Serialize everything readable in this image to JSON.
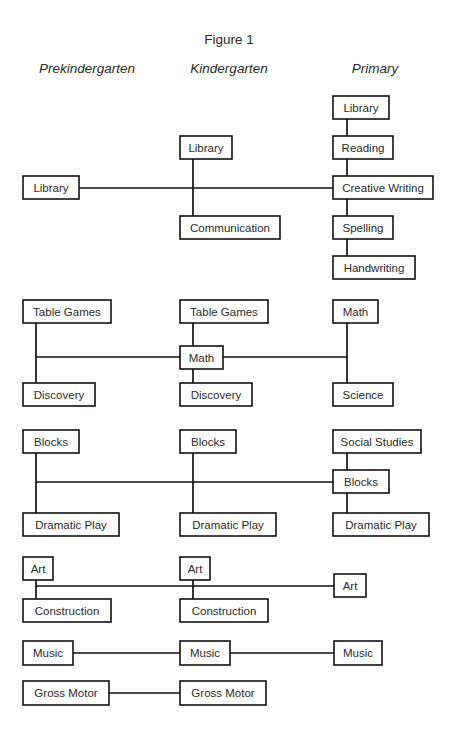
{
  "figure": {
    "title": "Figure 1",
    "title_x": 229,
    "title_y": 44
  },
  "columns": [
    {
      "id": "prekindergarten",
      "label": "Prekindergarten",
      "x": 87,
      "y": 73
    },
    {
      "id": "kindergarten",
      "label": "Kindergarten",
      "x": 229,
      "y": 73
    },
    {
      "id": "primary",
      "label": "Primary",
      "x": 375,
      "y": 73
    }
  ],
  "groups": [
    {
      "id": "language-arts",
      "nodes": [
        {
          "id": "pre-library",
          "label": "Library",
          "x": 23,
          "y": 176,
          "w": 56,
          "h": 23
        },
        {
          "id": "kin-library",
          "label": "Library",
          "x": 180,
          "y": 136,
          "w": 52,
          "h": 23
        },
        {
          "id": "kin-communication",
          "label": "Communication",
          "x": 180,
          "y": 216,
          "w": 100,
          "h": 23
        },
        {
          "id": "pri-library",
          "label": "Library",
          "x": 333,
          "y": 96,
          "w": 56,
          "h": 23
        },
        {
          "id": "pri-reading",
          "label": "Reading",
          "x": 333,
          "y": 136,
          "w": 60,
          "h": 23
        },
        {
          "id": "pri-creative-writing",
          "label": "Creative Writing",
          "x": 333,
          "y": 176,
          "w": 100,
          "h": 23
        },
        {
          "id": "pri-spelling",
          "label": "Spelling",
          "x": 333,
          "y": 216,
          "w": 60,
          "h": 23
        },
        {
          "id": "pri-handwriting",
          "label": "Handwriting",
          "x": 333,
          "y": 256,
          "w": 82,
          "h": 23
        }
      ],
      "links": [
        {
          "id": "la-spine-kin",
          "x1": 193,
          "y1": 159,
          "x2": 193,
          "y2": 216
        },
        {
          "id": "la-spine-pri-1",
          "x1": 347,
          "y1": 119,
          "x2": 347,
          "y2": 136
        },
        {
          "id": "la-spine-pri-2",
          "x1": 347,
          "y1": 159,
          "x2": 347,
          "y2": 176
        },
        {
          "id": "la-spine-pri-3",
          "x1": 347,
          "y1": 199,
          "x2": 347,
          "y2": 216
        },
        {
          "id": "la-spine-pri-4",
          "x1": 347,
          "y1": 239,
          "x2": 347,
          "y2": 256
        },
        {
          "id": "la-horizontal",
          "x1": 79,
          "y1": 188,
          "x2": 333,
          "y2": 188
        }
      ]
    },
    {
      "id": "math-science",
      "nodes": [
        {
          "id": "pre-table-games",
          "label": "Table Games",
          "x": 23,
          "y": 300,
          "w": 88,
          "h": 23
        },
        {
          "id": "pre-discovery",
          "label": "Discovery",
          "x": 23,
          "y": 383,
          "w": 72,
          "h": 23
        },
        {
          "id": "kin-table-games",
          "label": "Table Games",
          "x": 180,
          "y": 300,
          "w": 88,
          "h": 23
        },
        {
          "id": "kin-math",
          "label": "Math",
          "x": 180,
          "y": 346,
          "w": 43,
          "h": 23
        },
        {
          "id": "kin-discovery",
          "label": "Discovery",
          "x": 180,
          "y": 383,
          "w": 72,
          "h": 23
        },
        {
          "id": "pri-math",
          "label": "Math",
          "x": 333,
          "y": 300,
          "w": 45,
          "h": 23
        },
        {
          "id": "pri-science",
          "label": "Science",
          "x": 333,
          "y": 383,
          "w": 60,
          "h": 23
        }
      ],
      "links": [
        {
          "id": "ms-spine-pre",
          "x1": 36,
          "y1": 323,
          "x2": 36,
          "y2": 383
        },
        {
          "id": "ms-spine-kin-1",
          "x1": 193,
          "y1": 323,
          "x2": 193,
          "y2": 346
        },
        {
          "id": "ms-spine-kin-2",
          "x1": 193,
          "y1": 369,
          "x2": 193,
          "y2": 383
        },
        {
          "id": "ms-spine-pri",
          "x1": 347,
          "y1": 323,
          "x2": 347,
          "y2": 383
        },
        {
          "id": "ms-horiz-left",
          "x1": 36,
          "y1": 357,
          "x2": 180,
          "y2": 357
        },
        {
          "id": "ms-horiz-right",
          "x1": 223,
          "y1": 357,
          "x2": 347,
          "y2": 357
        }
      ]
    },
    {
      "id": "social-play",
      "nodes": [
        {
          "id": "pre-blocks",
          "label": "Blocks",
          "x": 23,
          "y": 430,
          "w": 56,
          "h": 23
        },
        {
          "id": "pre-dramatic-play",
          "label": "Dramatic Play",
          "x": 23,
          "y": 513,
          "w": 96,
          "h": 23
        },
        {
          "id": "kin-blocks",
          "label": "Blocks",
          "x": 180,
          "y": 430,
          "w": 56,
          "h": 23
        },
        {
          "id": "kin-dramatic-play",
          "label": "Dramatic Play",
          "x": 180,
          "y": 513,
          "w": 96,
          "h": 23
        },
        {
          "id": "pri-social-studies",
          "label": "Social Studies",
          "x": 333,
          "y": 430,
          "w": 88,
          "h": 23
        },
        {
          "id": "pri-blocks",
          "label": "Blocks",
          "x": 333,
          "y": 470,
          "w": 56,
          "h": 23
        },
        {
          "id": "pri-dramatic-play",
          "label": "Dramatic Play",
          "x": 333,
          "y": 513,
          "w": 96,
          "h": 23
        }
      ],
      "links": [
        {
          "id": "sp-spine-pre",
          "x1": 36,
          "y1": 453,
          "x2": 36,
          "y2": 513
        },
        {
          "id": "sp-spine-kin",
          "x1": 193,
          "y1": 453,
          "x2": 193,
          "y2": 513
        },
        {
          "id": "sp-spine-pri-1",
          "x1": 347,
          "y1": 453,
          "x2": 347,
          "y2": 470
        },
        {
          "id": "sp-spine-pri-2",
          "x1": 347,
          "y1": 493,
          "x2": 347,
          "y2": 513
        },
        {
          "id": "sp-horizontal",
          "x1": 36,
          "y1": 482,
          "x2": 333,
          "y2": 482
        }
      ]
    },
    {
      "id": "art-construction",
      "nodes": [
        {
          "id": "pre-art",
          "label": "Art",
          "x": 23,
          "y": 557,
          "w": 30,
          "h": 23
        },
        {
          "id": "pre-construction",
          "label": "Construction",
          "x": 23,
          "y": 599,
          "w": 88,
          "h": 23
        },
        {
          "id": "kin-art",
          "label": "Art",
          "x": 180,
          "y": 557,
          "w": 30,
          "h": 23
        },
        {
          "id": "kin-construction",
          "label": "Construction",
          "x": 180,
          "y": 599,
          "w": 88,
          "h": 23
        },
        {
          "id": "pri-art",
          "label": "Art",
          "x": 334,
          "y": 574,
          "w": 32,
          "h": 23
        }
      ],
      "links": [
        {
          "id": "ac-spine-pre",
          "x1": 36,
          "y1": 580,
          "x2": 36,
          "y2": 599
        },
        {
          "id": "ac-spine-kin",
          "x1": 193,
          "y1": 580,
          "x2": 193,
          "y2": 599
        },
        {
          "id": "ac-horizontal",
          "x1": 36,
          "y1": 586,
          "x2": 334,
          "y2": 586
        }
      ]
    },
    {
      "id": "music",
      "nodes": [
        {
          "id": "pre-music",
          "label": "Music",
          "x": 23,
          "y": 641,
          "w": 50,
          "h": 24
        },
        {
          "id": "kin-music",
          "label": "Music",
          "x": 180,
          "y": 641,
          "w": 50,
          "h": 24
        },
        {
          "id": "pri-music",
          "label": "Music",
          "x": 334,
          "y": 641,
          "w": 48,
          "h": 24
        }
      ],
      "links": [
        {
          "id": "mu-horiz-left",
          "x1": 73,
          "y1": 653,
          "x2": 180,
          "y2": 653
        },
        {
          "id": "mu-horiz-right",
          "x1": 230,
          "y1": 653,
          "x2": 334,
          "y2": 653
        }
      ]
    },
    {
      "id": "gross-motor",
      "nodes": [
        {
          "id": "pre-gross-motor",
          "label": "Gross Motor",
          "x": 23,
          "y": 681,
          "w": 86,
          "h": 24
        },
        {
          "id": "kin-gross-motor",
          "label": "Gross Motor",
          "x": 180,
          "y": 681,
          "w": 86,
          "h": 24
        }
      ],
      "links": [
        {
          "id": "gm-horizontal",
          "x1": 109,
          "y1": 693,
          "x2": 180,
          "y2": 693
        }
      ]
    }
  ]
}
